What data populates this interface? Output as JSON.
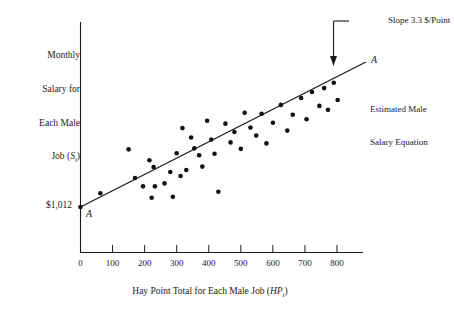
{
  "chart_data": {
    "type": "scatter",
    "title": "",
    "xlabel": "Hay Point Total for Each Male Job (HP_i)",
    "ylabel": "Monthly Salary for Each Male Job (S_i)",
    "xlim": [
      0,
      890
    ],
    "ylim": [
      0,
      4000
    ],
    "grid": false,
    "legend": "none",
    "x_ticks": [
      "0",
      "100",
      "200",
      "300",
      "400",
      "500",
      "600",
      "700",
      "800"
    ],
    "x_tick_values": [
      0,
      100,
      200,
      300,
      400,
      500,
      600,
      700,
      800
    ],
    "y_ticks": [
      "$1,012"
    ],
    "y_tick_values": [
      1012
    ],
    "annotations": [
      {
        "name": "slope-note",
        "text": "Slope 3.3 $/Point",
        "value": 3.3,
        "units": "$/Point"
      },
      {
        "name": "line-label-left",
        "text": "A"
      },
      {
        "name": "line-label-right",
        "text": "A"
      },
      {
        "name": "equation-note-line1",
        "text": "Estimated Male"
      },
      {
        "name": "equation-note-line2",
        "text": "Salary Equation"
      }
    ],
    "series": [
      {
        "name": "Estimated Male Salary Equation",
        "type": "line",
        "intercept": 1012,
        "slope": 3.3,
        "x": [
          0,
          890
        ],
        "y": [
          1012,
          3949
        ]
      },
      {
        "name": "Male jobs",
        "type": "scatter",
        "points": [
          [
            62,
            1290
          ],
          [
            150,
            2180
          ],
          [
            170,
            1600
          ],
          [
            195,
            1430
          ],
          [
            215,
            1960
          ],
          [
            222,
            1200
          ],
          [
            228,
            1820
          ],
          [
            232,
            1430
          ],
          [
            262,
            1490
          ],
          [
            280,
            1720
          ],
          [
            288,
            1220
          ],
          [
            300,
            2100
          ],
          [
            312,
            1640
          ],
          [
            318,
            2610
          ],
          [
            330,
            1760
          ],
          [
            345,
            2420
          ],
          [
            355,
            2200
          ],
          [
            370,
            2060
          ],
          [
            380,
            1830
          ],
          [
            395,
            2760
          ],
          [
            408,
            2380
          ],
          [
            418,
            2090
          ],
          [
            430,
            1320
          ],
          [
            452,
            2700
          ],
          [
            468,
            2320
          ],
          [
            480,
            2530
          ],
          [
            500,
            2190
          ],
          [
            512,
            2920
          ],
          [
            530,
            2620
          ],
          [
            548,
            2460
          ],
          [
            565,
            2900
          ],
          [
            580,
            2300
          ],
          [
            600,
            2720
          ],
          [
            625,
            3080
          ],
          [
            645,
            2560
          ],
          [
            662,
            2880
          ],
          [
            688,
            3220
          ],
          [
            705,
            2790
          ],
          [
            722,
            3340
          ],
          [
            745,
            3060
          ],
          [
            760,
            3420
          ],
          [
            772,
            2980
          ],
          [
            790,
            3530
          ],
          [
            802,
            3180
          ]
        ]
      }
    ]
  },
  "axis_labels": {
    "y_line1": "Monthly",
    "y_line2": "Salary for",
    "y_line3": "Each Male",
    "y_line4_pre": "Job (",
    "y_line4_sym": "S",
    "y_line4_sub": "i",
    "y_line4_post": ")",
    "x_pre": "Hay Point Total for Each Male Job (",
    "x_sym": "HP",
    "x_sub": "i",
    "x_post": ")"
  },
  "labels": {
    "intercept": "$1,012",
    "a_left": "A",
    "a_right": "A",
    "slope_note": "Slope 3.3 $/Point",
    "equation_line1": "Estimated Male",
    "equation_line2": "Salary Equation"
  },
  "colors": {
    "ink": "#1a1a1a",
    "point": "#111111",
    "background": "#ffffff"
  }
}
